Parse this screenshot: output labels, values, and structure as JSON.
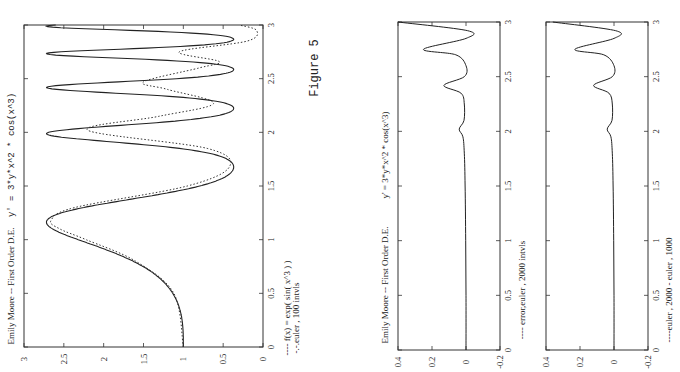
{
  "figure_label": "Figure 5",
  "orientation": "rotated 90 degrees counter-clockwise (landscape page printed sideways)",
  "chart_data": [
    {
      "id": "main",
      "type": "line",
      "title": "Emily Moore -- First Order D.E.     y' = 3*y*x^2 * cos(x^3)",
      "title_left": "Emily Moore -- First Order D.E.",
      "title_right": "y' = 3*y*x^2 * cos(x^3)",
      "xlabel": "",
      "ylabel": "",
      "xlim": [
        0,
        3
      ],
      "ylim": [
        0,
        3
      ],
      "xticks": [
        "0",
        "0.5",
        "1",
        "1.5",
        "2",
        "2.5",
        "3"
      ],
      "yticks": [
        "0",
        "0.5",
        "1",
        "1.5",
        "2",
        "2.5",
        "3"
      ],
      "grid": false,
      "legend": [
        "---- f(x) = exp( sin( x^3 ) )",
        "-.-.euler , 100 intvls"
      ],
      "series": [
        {
          "name": "f(x) = exp( sin( x^3 ) )",
          "style": "solid",
          "formula": "exp(sin(x^3))",
          "x": [
            0,
            0.5,
            0.8,
            1.0,
            1.1,
            1.16,
            1.3,
            1.5,
            1.66,
            1.8,
            1.99,
            2.1,
            2.24,
            2.35,
            2.4,
            2.5,
            2.61,
            2.68,
            2.74,
            2.82,
            2.87,
            2.95,
            3.0
          ],
          "y": [
            1.0,
            1.13,
            1.67,
            2.32,
            2.61,
            2.72,
            2.37,
            0.88,
            0.37,
            0.6,
            2.72,
            1.22,
            0.37,
            1.9,
            2.72,
            0.86,
            0.37,
            1.6,
            2.72,
            0.9,
            0.37,
            1.6,
            2.72
          ]
        },
        {
          "name": "euler , 100 intvls",
          "style": "dotted",
          "x": [
            0,
            0.5,
            0.8,
            1.0,
            1.1,
            1.18,
            1.3,
            1.5,
            1.68,
            1.85,
            2.02,
            2.15,
            2.27,
            2.4,
            2.47,
            2.6,
            2.66,
            2.75,
            2.85,
            2.95,
            3.0
          ],
          "y": [
            1.0,
            1.12,
            1.6,
            2.22,
            2.55,
            2.66,
            2.36,
            0.95,
            0.42,
            0.7,
            2.2,
            1.3,
            0.62,
            1.2,
            1.5,
            0.8,
            0.55,
            1.05,
            0.2,
            0.08,
            0.3
          ]
        }
      ]
    },
    {
      "id": "error",
      "type": "line",
      "title": "Emily Moore -- First Order D.E.     y' = 3*y*x^2 * cos(x^3)",
      "title_left": "Emily Moore -- First Order D.E.",
      "title_right": "y' = 3*y*x^2 * cos(x^3)",
      "xlim": [
        0,
        3
      ],
      "ylim": [
        -0.2,
        0.4
      ],
      "xticks": [
        "0",
        "0.5",
        "1",
        "1.5",
        "2",
        "2.5",
        "3"
      ],
      "yticks": [
        "-0.2",
        "0",
        "0.2",
        "0.4"
      ],
      "grid": false,
      "legend": [
        "---- error,euler , 2000 intvls"
      ],
      "series": [
        {
          "name": "error,euler , 2000 intvls",
          "style": "solid",
          "x": [
            0,
            0.5,
            1.0,
            1.5,
            1.8,
            1.95,
            2.02,
            2.1,
            2.25,
            2.35,
            2.42,
            2.5,
            2.6,
            2.7,
            2.75,
            2.85,
            2.92,
            3.0
          ],
          "y": [
            0.0,
            0.0,
            0.002,
            0.005,
            0.01,
            0.018,
            0.04,
            0.012,
            0.01,
            0.03,
            0.13,
            0.01,
            0.0,
            0.06,
            0.25,
            0.0,
            -0.01,
            0.4
          ]
        }
      ]
    },
    {
      "id": "difference",
      "type": "line",
      "title": "",
      "xlim": [
        0,
        3
      ],
      "ylim": [
        -0.2,
        0.4
      ],
      "xticks": [
        "0",
        "0.5",
        "1",
        "1.5",
        "2",
        "2.5",
        "3"
      ],
      "yticks": [
        "-0.2",
        "0",
        "0.2",
        "0.4"
      ],
      "grid": false,
      "legend": [
        "----euler , 2000 - euler , 1000"
      ],
      "series": [
        {
          "name": "euler , 2000 - euler , 1000",
          "style": "solid",
          "x": [
            0,
            0.5,
            1.0,
            1.5,
            1.8,
            1.95,
            2.02,
            2.1,
            2.25,
            2.35,
            2.42,
            2.5,
            2.6,
            2.7,
            2.75,
            2.85,
            2.92,
            3.0
          ],
          "y": [
            0.0,
            0.0,
            0.002,
            0.005,
            0.01,
            0.018,
            0.04,
            0.012,
            0.01,
            0.03,
            0.12,
            0.01,
            0.0,
            0.06,
            0.23,
            0.0,
            -0.01,
            0.36
          ]
        }
      ]
    }
  ],
  "panels": {
    "main": {
      "title_left": "Emily Moore -- First Order D.E.",
      "title_right": "y' = 3*y*x^2 * cos(x^3)",
      "legend_line1": "---- f(x) = exp( sin( x^3 ) )",
      "legend_line2": "-.-.euler , 100 intvls",
      "xticks": [
        "0",
        "0.5",
        "1",
        "1.5",
        "2",
        "2.5",
        "3"
      ],
      "yticks": [
        "0",
        "0.5",
        "1",
        "1.5",
        "2",
        "2.5",
        "3"
      ]
    },
    "error": {
      "title_left": "Emily Moore -- First Order D.E.",
      "title_right": "y' = 3*y*x^2 * cos(x^3)",
      "legend": "---- error,euler , 2000 intvls",
      "xticks": [
        "0",
        "0.5",
        "1",
        "1.5",
        "2",
        "2.5",
        "3"
      ],
      "yticks": [
        "-0.2",
        "0",
        "0.2",
        "0.4"
      ]
    },
    "difference": {
      "legend": "----euler , 2000 - euler , 1000",
      "xticks": [
        "0",
        "0.5",
        "1",
        "1.5",
        "2",
        "2.5",
        "3"
      ],
      "yticks": [
        "-0.2",
        "0",
        "0.2",
        "0.4"
      ]
    }
  }
}
